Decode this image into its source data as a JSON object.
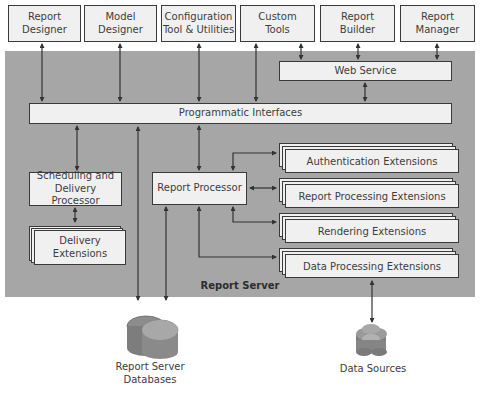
{
  "top_row": [
    {
      "line1": "Report",
      "line2": "Designer"
    },
    {
      "line1": "Model",
      "line2": "Designer"
    },
    {
      "line1": "Configuration",
      "line2": "Tool & Utilities"
    },
    {
      "line1": "Custom",
      "line2": "Tools"
    },
    {
      "line1": "Report",
      "line2": "Builder"
    },
    {
      "line1": "Report",
      "line2": "Manager"
    }
  ],
  "server": {
    "label": "Report Server",
    "web_service": "Web Service",
    "programmatic_interfaces": "Programmatic Interfaces",
    "scheduling": {
      "line1": "Scheduling and",
      "line2": "Delivery Processor"
    },
    "delivery_extensions": {
      "line1": "Delivery",
      "line2": "Extensions"
    },
    "report_processor": "Report Processor",
    "extensions": [
      "Authentication Extensions",
      "Report Processing Extensions",
      "Rendering Extensions",
      "Data Processing Extensions"
    ]
  },
  "outside": {
    "databases": {
      "line1": "Report Server",
      "line2": "Databases"
    },
    "data_sources": "Data Sources"
  },
  "colors": {
    "server_background": "#a6a6a6",
    "box_fill": "#f0f0f0",
    "border": "#3a3a3a"
  }
}
